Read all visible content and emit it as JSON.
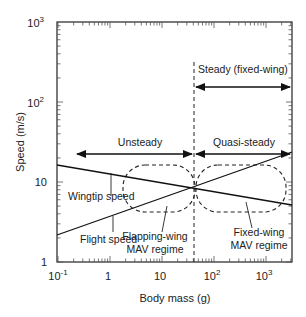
{
  "chart_data": {
    "type": "line",
    "title": "",
    "xlabel": "Body mass (g)",
    "ylabel": "Speed (m/s)",
    "xscale": "log",
    "yscale": "log",
    "xlim": [
      0.1,
      3000
    ],
    "ylim": [
      1,
      1000
    ],
    "x_ticks": [
      "10-1",
      "1",
      "10",
      "102",
      "103"
    ],
    "y_ticks": [
      "1",
      "10",
      "102",
      "103"
    ],
    "grid": false,
    "series": [
      {
        "name": "Wingtip speed",
        "x": [
          0.1,
          40,
          3000
        ],
        "y": [
          16,
          8.5,
          5.9
        ]
      },
      {
        "name": "Flight speed",
        "x": [
          0.1,
          40,
          3000
        ],
        "y": [
          2.3,
          8.5,
          23
        ]
      }
    ],
    "annotations": [
      {
        "text": "Steady (fixed-wing)",
        "type": "arrow-range",
        "x_from": 40,
        "x_to": 3000,
        "y": 300
      },
      {
        "text": "Unsteady",
        "type": "arrow-range",
        "x_from": 0.25,
        "x_to": 40,
        "y": 22
      },
      {
        "text": "Quasi-steady",
        "type": "arrow-range",
        "x_from": 40,
        "x_to": 3000,
        "y": 22
      },
      {
        "text": "Flapping-wing MAV regime",
        "type": "dashed-region",
        "x_from": 3,
        "x_to": 40
      },
      {
        "text": "Fixed-wing MAV regime",
        "type": "dashed-region",
        "x_from": 40,
        "x_to": 2500
      },
      {
        "text": "",
        "type": "vertical-dashed-line",
        "x": 40
      }
    ]
  },
  "labels": {
    "steady": "Steady (fixed-wing)",
    "unsteady": "Unsteady",
    "quasi": "Quasi-steady",
    "wingtip": "Wingtip speed",
    "flight": "Flight speed",
    "flap1": "Flapping-wing",
    "flap2": "MAV regime",
    "fixed1": "Fixed-wing",
    "fixed2": "MAV regime",
    "xlabel": "Body mass (g)",
    "ylabel": "Speed (m/s)"
  },
  "ticks": {
    "x": [
      {
        "base": "10",
        "exp": "-1"
      },
      {
        "base": "1",
        "exp": ""
      },
      {
        "base": "10",
        "exp": ""
      },
      {
        "base": "10",
        "exp": "2"
      },
      {
        "base": "10",
        "exp": "3"
      }
    ],
    "y": [
      {
        "base": "1",
        "exp": ""
      },
      {
        "base": "10",
        "exp": ""
      },
      {
        "base": "10",
        "exp": "2"
      },
      {
        "base": "10",
        "exp": "3"
      }
    ]
  }
}
